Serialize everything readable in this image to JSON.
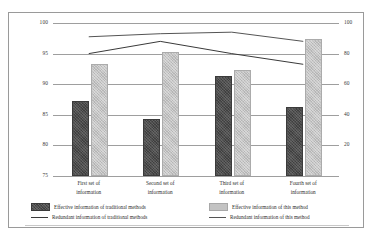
{
  "figure": {
    "top_caption_partial": "",
    "background_color": "#ffffff",
    "border_color": "#9a9a9a"
  },
  "chart_data": {
    "type": "bar",
    "title": "",
    "subtitle": "",
    "xlabel": "",
    "ylabel": "",
    "categories": [
      "First set of\ninformation",
      "Second set of\ninformation",
      "Third set of\ninformation",
      "Fourth set of\ninformation"
    ],
    "grid": true,
    "legend_position": "bottom",
    "left_axis": {
      "label": "",
      "ticks": [
        75,
        80,
        85,
        90,
        95,
        100
      ],
      "tick_labels": [
        "75",
        "80",
        "85",
        "90",
        "95",
        "100"
      ],
      "ylim": [
        75,
        100
      ]
    },
    "right_axis": {
      "label": "",
      "ticks": [
        0,
        20,
        40,
        60,
        80,
        100
      ],
      "tick_labels": [
        "",
        "20",
        "40",
        "60",
        "80",
        "100"
      ],
      "ylim": [
        0,
        100
      ]
    },
    "series": [
      {
        "name": "Effective information of traditional methods",
        "type": "bar",
        "axis": "left",
        "color": "#4d4d4d",
        "values": [
          87,
          84,
          91,
          86
        ]
      },
      {
        "name": "Effective information of this method",
        "type": "bar",
        "axis": "left",
        "color": "#c3c3c3",
        "values": [
          93,
          95,
          92,
          97
        ]
      },
      {
        "name": "Redundant information of traditional methods",
        "type": "line",
        "axis": "right",
        "color": "#3a3a3a",
        "values": [
          80,
          88,
          80,
          73
        ]
      },
      {
        "name": "Redundant information of this method",
        "type": "line",
        "axis": "right",
        "color": "#555555",
        "values": [
          91,
          93,
          94,
          88
        ]
      }
    ]
  },
  "legend": {
    "items": [
      {
        "label": "Effective information of traditional methods",
        "marker": "box-dark"
      },
      {
        "label": "Effective information of this method",
        "marker": "box-light"
      },
      {
        "label": "Redundant information of traditional methods",
        "marker": "line-dark"
      },
      {
        "label": "Redundant information of this method",
        "marker": "line-gray"
      }
    ]
  }
}
